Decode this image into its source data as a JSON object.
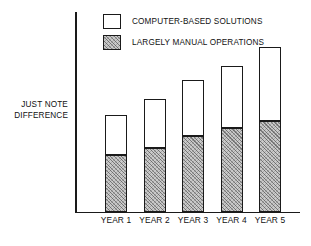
{
  "chart_data": {
    "type": "bar",
    "subtype": "stacked-bar",
    "title": "",
    "xlabel": "",
    "ylabel": "JUST NOTE DIFFERENCE",
    "ylabel_lines": [
      "JUST NOTE",
      "DIFFERENCE"
    ],
    "axis": {
      "y_ticks": [],
      "x_ticks_shown": true,
      "grid": false,
      "ylim": [
        0,
        1
      ],
      "y_axis_unlabeled": true
    },
    "categories": [
      "YEAR 1",
      "YEAR 2",
      "YEAR 3",
      "YEAR 4",
      "YEAR 5"
    ],
    "series": [
      {
        "name": "LARGELY MANUAL OPERATIONS",
        "fill": "diagonal-hatch",
        "color": "#c9c9c9",
        "values": [
          0.285,
          0.32,
          0.38,
          0.42,
          0.455
        ]
      },
      {
        "name": "COMPUTER-BASED SOLUTIONS",
        "fill": "dotted-stipple",
        "color": "#ffffff",
        "values": [
          0.2,
          0.245,
          0.28,
          0.31,
          0.37
        ]
      }
    ],
    "totals": [
      0.485,
      0.565,
      0.66,
      0.73,
      0.825
    ],
    "legend": {
      "position": "top-center",
      "entries": [
        {
          "label": "COMPUTER-BASED SOLUTIONS",
          "fill": "dotted-stipple"
        },
        {
          "label": "LARGELY MANUAL OPERATIONS",
          "fill": "diagonal-hatch"
        }
      ]
    },
    "colors": {
      "axis": "#1a1a1a",
      "outline": "#1a1a1a",
      "hatch": "#c9c9c9",
      "dots": "#ffffff",
      "text": "#111111",
      "background": "#ffffff"
    }
  }
}
